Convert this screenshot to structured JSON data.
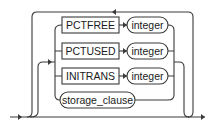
{
  "diagram": {
    "type": "railroad-syntax",
    "keywords": [
      {
        "label": "PCTFREE",
        "operand": "integer"
      },
      {
        "label": "PCTUSED",
        "operand": "integer"
      },
      {
        "label": "INITRANS",
        "operand": "integer"
      }
    ],
    "clause": {
      "label": "storage_clause"
    },
    "colors": {
      "stroke": "#3a3a3a",
      "text": "#1a1a1a",
      "background": "#ffffff"
    }
  }
}
